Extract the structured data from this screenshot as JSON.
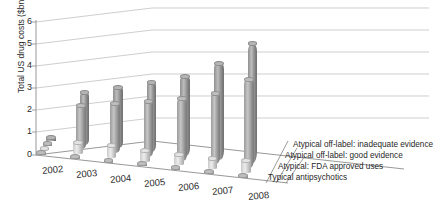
{
  "chart_data": {
    "type": "bar",
    "subtype": "3d-grouped-cylinder",
    "title": "",
    "xlabel": "",
    "ylabel": "Total US drug costs ($bn)",
    "categories": [
      "2002",
      "2003",
      "2004",
      "2005",
      "2006",
      "2007",
      "2008"
    ],
    "ylim": [
      0,
      6
    ],
    "yticks": [
      0,
      1,
      2,
      3,
      4,
      5,
      6
    ],
    "grid": true,
    "legend_position": "bottom-right",
    "series": [
      {
        "name": "Atypical off-label: inadequate evidence",
        "color": "#9a9a9a",
        "values": [
          0.15,
          2.35,
          2.75,
          3.15,
          3.6,
          4.35,
          5.4
        ]
      },
      {
        "name": "Atypical off-label: good evidence",
        "color": "#aaaaaa",
        "values": [
          0.12,
          2.0,
          2.25,
          2.5,
          2.8,
          3.2,
          4.0
        ]
      },
      {
        "name": "Atypical: FDA approved uses",
        "color": "#dcdcdc",
        "values": [
          0.1,
          0.55,
          0.55,
          0.5,
          0.5,
          0.5,
          0.55
        ]
      },
      {
        "name": "Typical antipsychotics",
        "color": "#b4b4b4",
        "values": [
          0.08,
          0.08,
          0.08,
          0.07,
          0.07,
          0.07,
          0.07
        ]
      }
    ]
  },
  "axis": {
    "y_label": "Total US drug costs ($bn)",
    "y_ticks": [
      "6",
      "5",
      "4",
      "3",
      "2",
      "1",
      "0"
    ],
    "x_ticks": [
      "2002",
      "2003",
      "2004",
      "2005",
      "2006",
      "2007",
      "2008"
    ]
  },
  "legend": {
    "items": [
      {
        "label": "Atypical off-label: inadequate evidence"
      },
      {
        "label": "Atypical off-label: good evidence"
      },
      {
        "label": "Atypical: FDA approved uses"
      },
      {
        "label": "Typical antipsychotics"
      }
    ]
  }
}
